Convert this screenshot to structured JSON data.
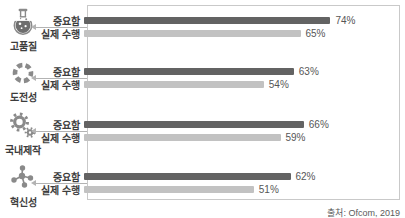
{
  "chart_data": {
    "type": "bar",
    "orientation": "horizontal",
    "unit": "%",
    "xlim": [
      0,
      94
    ],
    "grid": false,
    "legend_position": "per-row-labels",
    "series": [
      {
        "name": "중요함",
        "color": "#636363"
      },
      {
        "name": "실제 수행",
        "color": "#c2c2c2"
      }
    ],
    "groups": [
      {
        "category": "고품질",
        "icon": "flask-icon",
        "values": [
          74,
          65
        ],
        "value_labels": [
          "74%",
          "65%"
        ]
      },
      {
        "category": "도전성",
        "icon": "aperture-icon",
        "values": [
          63,
          54
        ],
        "value_labels": [
          "63%",
          "54%"
        ]
      },
      {
        "category": "국내제작",
        "icon": "gears-icon",
        "values": [
          66,
          59
        ],
        "value_labels": [
          "66%",
          "59%"
        ]
      },
      {
        "category": "혁신성",
        "icon": "molecule-icon",
        "values": [
          62,
          51
        ],
        "value_labels": [
          "62%",
          "51%"
        ]
      }
    ]
  },
  "source_note": "출처: Ofcom, 2019",
  "colors": {
    "importance_bar": "#636363",
    "actual_bar": "#c2c2c2",
    "frame_border": "#c9c9c9",
    "icon_gray": "#8a8a8a"
  }
}
